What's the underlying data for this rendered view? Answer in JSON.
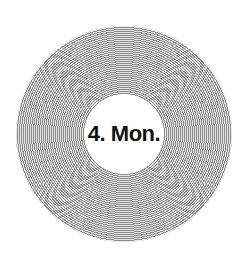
{
  "record": {
    "label_text": "4. Mon."
  },
  "colors": {
    "groove_dark": "#8a8a8a",
    "groove_light": "#e6e6e6",
    "label_background": "#ffffff",
    "label_text": "#111111"
  }
}
